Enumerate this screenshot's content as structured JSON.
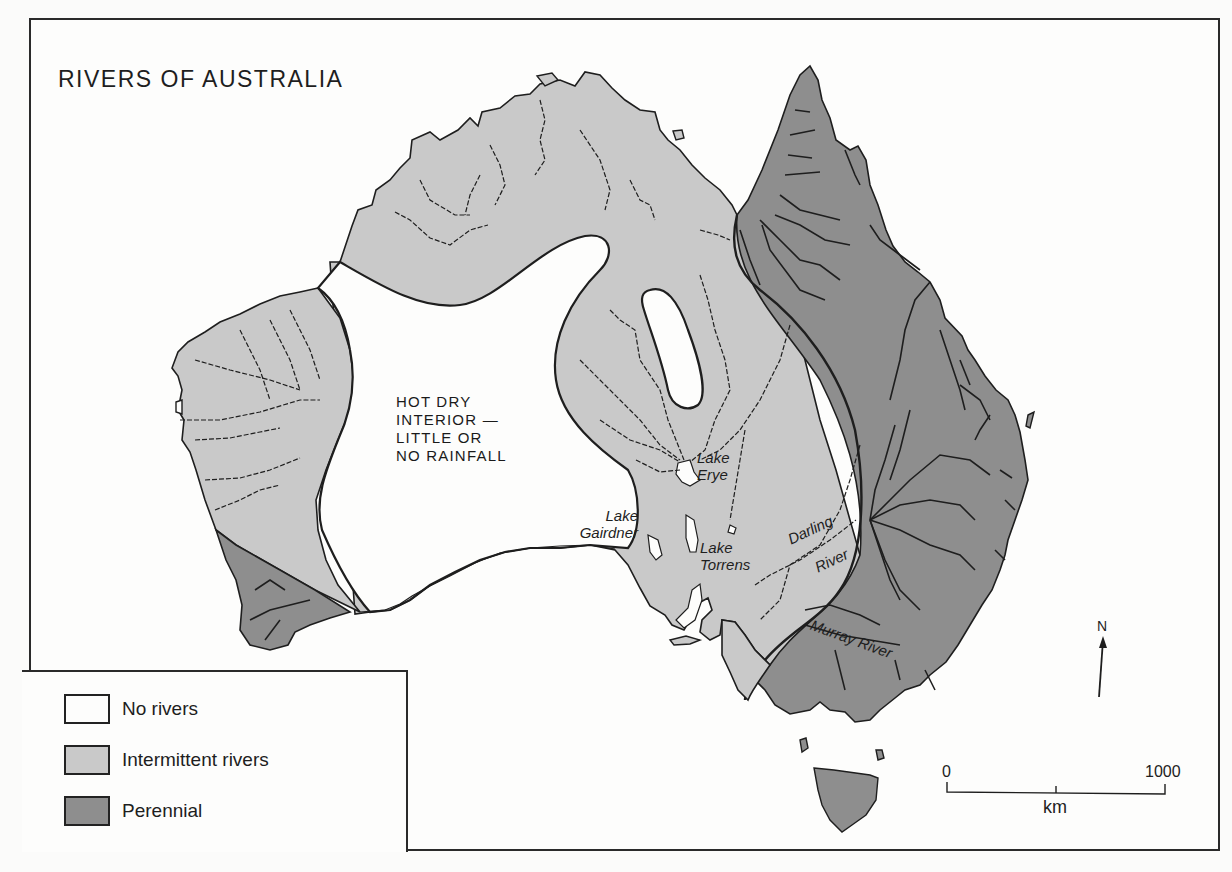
{
  "map": {
    "title": "RIVERS OF AUSTRALIA",
    "colors": {
      "no_rivers": "#fdfdfc",
      "intermittent": "#c9c9c9",
      "perennial": "#8e8e8e",
      "outline": "#1e1e1e"
    },
    "annotations": {
      "interior_lines": [
        "HOT DRY",
        "INTERIOR —",
        "LITTLE OR",
        "NO RAINFALL"
      ],
      "lake_eyre": [
        "Lake",
        "Erye"
      ],
      "lake_gairdner": [
        "Lake",
        "Gairdner"
      ],
      "lake_torrens": [
        "Lake",
        "Torrens"
      ],
      "darling_river": [
        "Darling",
        "River"
      ],
      "murray_river": "Murray River"
    },
    "north_arrow": {
      "label": "N"
    },
    "scale_bar": {
      "start": "0",
      "end": "1000",
      "unit": "km"
    }
  },
  "legend": {
    "items": [
      {
        "label": "No rivers",
        "color": "#fdfdfc"
      },
      {
        "label": "Intermittent rivers",
        "color": "#c9c9c9"
      },
      {
        "label": "Perennial",
        "color": "#8e8e8e"
      }
    ]
  }
}
